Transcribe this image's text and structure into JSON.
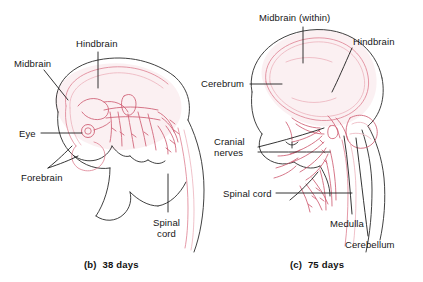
{
  "figure": {
    "background_color": "#ffffff",
    "outline_color": "#2b2b2b",
    "nervous_tissue_color": "#d4697d",
    "nervous_tissue_light_color": "#e79aa6",
    "label_color": "#161616"
  },
  "panels": [
    {
      "id": "b",
      "caption": "(b)  38 days",
      "subject": "human embryo at 38 days, lateral view",
      "labels": [
        {
          "key": "hindbrain",
          "text": "Hindbrain",
          "leader": "vertical"
        },
        {
          "key": "midbrain",
          "text": "Midbrain",
          "leader": "diagonal"
        },
        {
          "key": "eye",
          "text": "Eye",
          "leader": "horizontal"
        },
        {
          "key": "forebrain",
          "text": "Forebrain",
          "leader": "double-diagonal"
        },
        {
          "key": "spinal_cord",
          "text": "Spinal\ncord",
          "leader": "vertical"
        }
      ]
    },
    {
      "id": "c",
      "caption": "(c)  75 days",
      "subject": "human fetus at 75 days, lateral view of head and neck",
      "labels": [
        {
          "key": "midbrain",
          "text": "Midbrain (within)",
          "leader": "vertical"
        },
        {
          "key": "hindbrain",
          "text": "Hindbrain",
          "leader": "diagonal"
        },
        {
          "key": "cerebrum",
          "text": "Cerebrum",
          "leader": "horizontal"
        },
        {
          "key": "cranial_nerves",
          "text": "Cranial\nnerves",
          "leader": "double-diagonal"
        },
        {
          "key": "spinal_cord",
          "text": "Spinal cord",
          "leader": "horizontal"
        },
        {
          "key": "medulla",
          "text": "Medulla",
          "leader": "long-vertical"
        },
        {
          "key": "cerebellum",
          "text": "Cerebellum",
          "leader": "long-vertical"
        }
      ]
    }
  ]
}
